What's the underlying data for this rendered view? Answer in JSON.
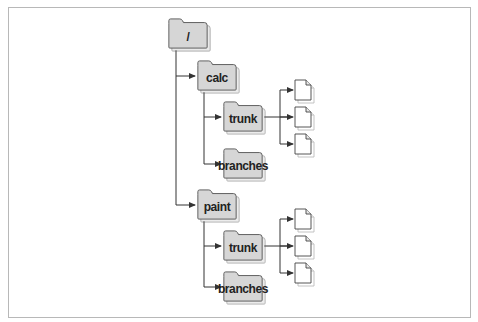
{
  "diagram": {
    "type": "directory-tree",
    "colors": {
      "folder_fill": "#d6d6d6",
      "folder_stroke": "#555555",
      "shadow": "#9a9a9a",
      "line": "#333333",
      "file_fill": "#ffffff"
    },
    "root": {
      "label": "/"
    },
    "projects": [
      {
        "label": "calc",
        "children": [
          {
            "label": "trunk",
            "file_count": 3
          },
          {
            "label": "branches"
          }
        ]
      },
      {
        "label": "paint",
        "children": [
          {
            "label": "trunk",
            "file_count": 3
          },
          {
            "label": "branches"
          }
        ]
      }
    ]
  }
}
